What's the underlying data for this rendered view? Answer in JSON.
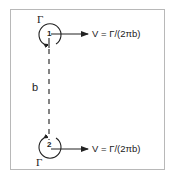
{
  "diagram": {
    "type": "vortex-pair",
    "vortices": [
      {
        "id": 1,
        "label": "1",
        "circulation_label": "Γ",
        "rotation": "counterclockwise",
        "velocity_label": "V = Γ/(2πb)"
      },
      {
        "id": 2,
        "label": "2",
        "circulation_label": "Γ",
        "rotation": "clockwise",
        "velocity_label": "V = Γ/(2πb)"
      }
    ],
    "separation_label": "b",
    "colors": {
      "stroke": "#222222",
      "frame": "#b8b8b8",
      "background": "#ffffff"
    }
  }
}
